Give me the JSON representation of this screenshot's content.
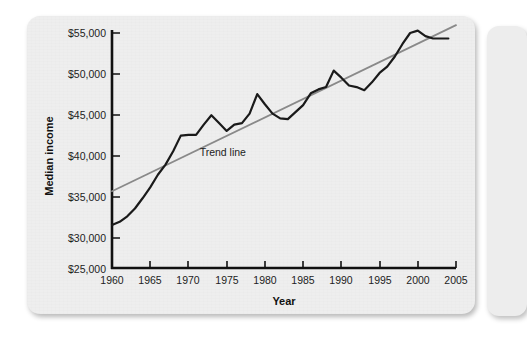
{
  "figure": {
    "card_background": "#eeeeee",
    "page_background": "#ffffff"
  },
  "chart_data": {
    "type": "line",
    "title": "",
    "xlabel": "Year",
    "ylabel": "Median income",
    "xlim": [
      1960,
      2005
    ],
    "ylim": [
      25000,
      55000
    ],
    "xticks": [
      1960,
      1965,
      1970,
      1975,
      1980,
      1985,
      1990,
      1995,
      2000,
      2005
    ],
    "xtick_labels": [
      "1960",
      "1965",
      "1970",
      "1975",
      "1980",
      "1985",
      "1990",
      "1995",
      "2000",
      "2005"
    ],
    "yticks": [
      25000,
      30000,
      35000,
      40000,
      45000,
      50000,
      55000
    ],
    "ytick_labels": [
      "$25,000",
      "$30,000",
      "$35,000",
      "$40,000",
      "$45,000",
      "$50,000",
      "$55,000"
    ],
    "grid": false,
    "legend": null,
    "series": [
      {
        "name": "Median income",
        "type": "line",
        "color": "#1a1a1a",
        "width": 2.2,
        "x": [
          1960,
          1961,
          1962,
          1963,
          1964,
          1965,
          1966,
          1967,
          1968,
          1969,
          1970,
          1971,
          1972,
          1973,
          1974,
          1975,
          1976,
          1977,
          1978,
          1979,
          1980,
          1981,
          1982,
          1983,
          1984,
          1985,
          1986,
          1987,
          1988,
          1989,
          1990,
          1991,
          1992,
          1993,
          1994,
          1995,
          1996,
          1997,
          1998,
          1999,
          2000,
          2001,
          2002,
          2003,
          2004
        ],
        "values": [
          30500,
          30900,
          31600,
          32600,
          33900,
          35300,
          36900,
          38200,
          39900,
          41900,
          42000,
          42000,
          43300,
          44500,
          43500,
          42500,
          43300,
          43500,
          44700,
          47200,
          45900,
          44700,
          44100,
          44000,
          44900,
          45800,
          47300,
          47800,
          48100,
          50200,
          49300,
          48300,
          48100,
          47700,
          48700,
          49900,
          50700,
          52000,
          53600,
          55000,
          55300,
          54600,
          54300,
          54300,
          54300
        ]
      },
      {
        "name": "Trend line",
        "type": "line",
        "color": "#8a8a8a",
        "width": 1.8,
        "straight": true,
        "x": [
          1960,
          2005
        ],
        "values": [
          34800,
          56000
        ]
      }
    ],
    "annotations": [
      {
        "name": "trend-line-label",
        "text": "Trend line",
        "x": 1974.5,
        "y": 39300
      }
    ]
  }
}
